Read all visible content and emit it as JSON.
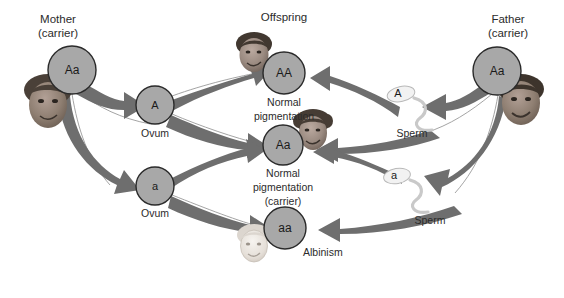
{
  "diagram": {
    "colors": {
      "circle_fill": "#a8a8a8",
      "circle_stroke": "#2a2a2a",
      "arrow": "#6e6e6e",
      "text": "#2b2b2b",
      "background": "#ffffff",
      "sperm": "#f2f2f2"
    },
    "headings": {
      "mother": "Mother",
      "mother_sub": "(carrier)",
      "offspring": "Offspring",
      "father": "Father",
      "father_sub": "(carrier)"
    },
    "parents": [
      {
        "id": "mother",
        "genotype": "Aa",
        "label": "Mother",
        "sublabel": "(carrier)",
        "cx": 72,
        "cy": 70,
        "r": 24
      },
      {
        "id": "father",
        "genotype": "Aa",
        "label": "Father",
        "sublabel": "(carrier)",
        "cx": 497,
        "cy": 71,
        "r": 24
      }
    ],
    "gametes": [
      {
        "id": "ovum-A",
        "allele": "A",
        "type": "Ovum",
        "cx": 155,
        "cy": 105,
        "r": 19
      },
      {
        "id": "ovum-a",
        "allele": "a",
        "type": "Ovum",
        "cx": 155,
        "cy": 186,
        "r": 19
      },
      {
        "id": "sperm-A",
        "allele": "A",
        "type": "Sperm",
        "head_x": 398,
        "head_y": 95
      },
      {
        "id": "sperm-a",
        "allele": "a",
        "type": "Sperm",
        "head_x": 395,
        "head_y": 177
      }
    ],
    "offspring": [
      {
        "id": "offspring-AA",
        "genotype": "AA",
        "phenotype_line1": "Normal",
        "phenotype_line2": "pigmentation",
        "phenotype_line3": "",
        "cx": 284,
        "cy": 73,
        "r": 21
      },
      {
        "id": "offspring-Aa",
        "genotype": "Aa",
        "phenotype_line1": "Normal",
        "phenotype_line2": "pigmentation",
        "phenotype_line3": "(carrier)",
        "cx": 283,
        "cy": 145,
        "r": 20
      },
      {
        "id": "offspring-aa",
        "genotype": "aa",
        "phenotype_line1": "Albinism",
        "phenotype_line2": "",
        "phenotype_line3": "",
        "cx": 285,
        "cy": 228,
        "r": 21
      }
    ],
    "labels": {
      "ovum": "Ovum",
      "sperm": "Sperm",
      "normal": "Normal",
      "pigmentation": "pigmentation",
      "carrier": "(carrier)",
      "albinism": "Albinism"
    },
    "portraits": [
      {
        "id": "mother-portrait",
        "role": "mother-face",
        "cx": 48,
        "cy": 103,
        "rx": 22,
        "ry": 25,
        "skin": "#8f7f72",
        "hair": "#4a4038"
      },
      {
        "id": "father-portrait",
        "role": "father-face",
        "cx": 520,
        "cy": 101,
        "rx": 22,
        "ry": 24,
        "skin": "#8b7a6d",
        "hair": "#3d342c"
      },
      {
        "id": "child-AA-portrait",
        "role": "child-normal-face",
        "cx": 254,
        "cy": 54,
        "rx": 17,
        "ry": 19,
        "skin": "#93837a",
        "hair": "#413830"
      },
      {
        "id": "child-Aa-portrait",
        "role": "child-carrier-face",
        "cx": 313,
        "cy": 132,
        "rx": 17,
        "ry": 19,
        "skin": "#9a8a80",
        "hair": "#463c34"
      },
      {
        "id": "child-aa-portrait",
        "role": "child-albino-face",
        "cx": 254,
        "cy": 244,
        "rx": 16,
        "ry": 18,
        "skin": "#e8e3dd",
        "hair": "#d8d2cb"
      }
    ]
  }
}
